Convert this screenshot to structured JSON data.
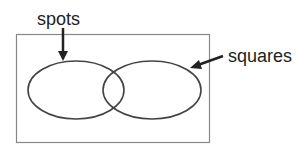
{
  "diagram": {
    "type": "venn",
    "labels": {
      "left_set": "spots",
      "right_set": "squares"
    },
    "colors": {
      "outline": "#444444",
      "frame": "#888888",
      "text": "#222222"
    }
  }
}
